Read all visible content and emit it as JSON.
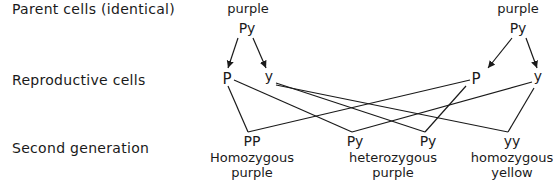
{
  "row_labels": {
    "parents": "Parent cells (identical)",
    "reproductive": "Reproductive cells",
    "second": "Second generation"
  },
  "parents": [
    {
      "phenotype": "purple",
      "genotype": "Py"
    },
    {
      "phenotype": "purple",
      "genotype": "Py"
    }
  ],
  "gametes": {
    "left": [
      "P",
      "y"
    ],
    "right": [
      "P",
      "y"
    ]
  },
  "offspring": [
    {
      "genotype": "PP",
      "phenotype_line1": "Homozygous",
      "phenotype_line2": "purple"
    },
    {
      "genotype": "Py"
    },
    {
      "genotype": "Py"
    },
    {
      "genotype": "yy",
      "phenotype_line1": "homozygous",
      "phenotype_line2": "yellow"
    }
  ],
  "heterozygous_label": {
    "line1": "heterozygous",
    "line2": "purple"
  },
  "colors": {
    "ink": "#1a1a1a",
    "background": "#ffffff"
  }
}
